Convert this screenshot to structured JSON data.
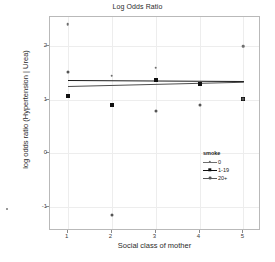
{
  "chart_data": {
    "type": "scatter",
    "title": "Log Odds Ratio",
    "xlabel": "Social class of mother",
    "ylabel": "log odds ratio (Hypertension | Urea)",
    "xlim": [
      0.6,
      5.4
    ],
    "ylim": [
      -1.45,
      2.55
    ],
    "grid": true,
    "legend_position": "inside-right",
    "legend_title": "smoke",
    "xticks": [
      1,
      2,
      3,
      4,
      5
    ],
    "xtick_labels": [
      "1",
      "2",
      "3",
      "4",
      "5"
    ],
    "yticks": [
      -1,
      0,
      1,
      2
    ],
    "ytick_labels": [
      "-1",
      "0",
      "1",
      "2"
    ],
    "series": [
      {
        "name": "0",
        "marker": "small-circle",
        "color": "#6e6e6e",
        "x": [
          1,
          2,
          3,
          4,
          5
        ],
        "values": [
          2.42,
          1.45,
          1.6,
          1.32,
          2.0
        ]
      },
      {
        "name": "1-19",
        "marker": "filled-square",
        "color": "#111111",
        "x": [
          1,
          2,
          3,
          4,
          5
        ],
        "values": [
          1.08,
          0.9,
          1.37,
          1.3,
          1.02
        ]
      },
      {
        "name": "20+",
        "marker": "medium-circle",
        "color": "#555555",
        "x": [
          1,
          2,
          3,
          4,
          5
        ],
        "values": [
          1.53,
          -1.15,
          0.8,
          0.9,
          1.02
        ]
      }
    ],
    "fit_lines": [
      {
        "name": "fit-upper",
        "color": "#1a1a1a",
        "x": [
          1,
          5
        ],
        "y": [
          1.37,
          1.35
        ]
      },
      {
        "name": "fit-lower",
        "color": "#4d4d4d",
        "x": [
          1,
          5
        ],
        "y": [
          1.27,
          1.35
        ]
      }
    ],
    "legend_entries": [
      {
        "label": "0",
        "color": "#6e6e6e",
        "marker": "small-circle"
      },
      {
        "label": "1-19",
        "color": "#111111",
        "marker": "filled-square"
      },
      {
        "label": "20+",
        "color": "#555555",
        "marker": "medium-circle"
      }
    ]
  }
}
